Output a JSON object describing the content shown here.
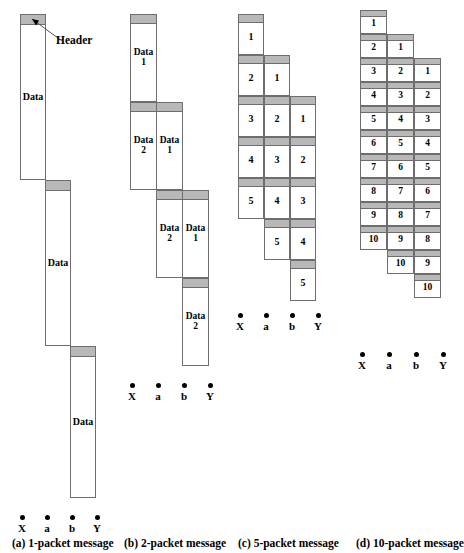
{
  "figure": {
    "annotation": {
      "header_label": "Header"
    },
    "colors": {
      "header_fill": "#b8b8b8",
      "body_fill": "#ffffff",
      "stroke": "#6e6e6e",
      "text": "#000000"
    },
    "node_labels": [
      "X",
      "a",
      "b",
      "Y"
    ],
    "panels": [
      {
        "id": "a",
        "caption": "(a) 1-packet message",
        "packets_total": 1,
        "hops": [
          "X",
          "a",
          "b",
          "Y"
        ],
        "blocks": [
          {
            "hop": 0,
            "label": "Data"
          },
          {
            "hop": 1,
            "label": "Data"
          },
          {
            "hop": 2,
            "label": "Data"
          }
        ]
      },
      {
        "id": "b",
        "caption": "(b) 2-packet message",
        "packets_total": 2,
        "hops": [
          "X",
          "a",
          "b",
          "Y"
        ],
        "blocks": [
          {
            "hop": 0,
            "label": "Data\n1"
          },
          {
            "hop": 0,
            "label": "Data\n2"
          },
          {
            "hop": 1,
            "label": "Data\n1"
          },
          {
            "hop": 1,
            "label": "Data\n2"
          },
          {
            "hop": 2,
            "label": "Data\n1"
          },
          {
            "hop": 2,
            "label": "Data\n2"
          }
        ]
      },
      {
        "id": "c",
        "caption": "(c) 5-packet message",
        "packets_total": 5,
        "hops": [
          "X",
          "a",
          "b",
          "Y"
        ],
        "column_sequences": [
          [
            "1",
            "2",
            "3",
            "4",
            "5"
          ],
          [
            "1",
            "2",
            "3",
            "4",
            "5"
          ],
          [
            "1",
            "2",
            "3",
            "4",
            "5"
          ]
        ]
      },
      {
        "id": "d",
        "caption": "(d) 10-packet message",
        "packets_total": 10,
        "hops": [
          "X",
          "a",
          "b",
          "Y"
        ],
        "column_sequences": [
          [
            "1",
            "2",
            "3",
            "4",
            "5",
            "6",
            "7",
            "8",
            "9",
            "10"
          ],
          [
            "1",
            "2",
            "3",
            "4",
            "5",
            "6",
            "7",
            "8",
            "9",
            "10"
          ],
          [
            "1",
            "2",
            "3",
            "4",
            "5",
            "6",
            "7",
            "8",
            "9",
            "10"
          ]
        ]
      }
    ]
  }
}
